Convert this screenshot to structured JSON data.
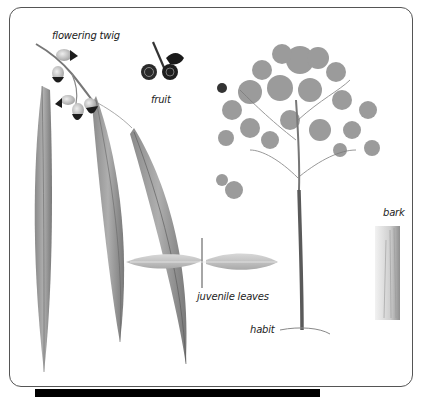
{
  "figure": {
    "labels": {
      "flowering_twig": "flowering twig",
      "fruit": "fruit",
      "juvenile_leaves": "juvenile leaves",
      "habit": "habit",
      "bark": "bark"
    }
  },
  "colors": {
    "frame_border": "#555555",
    "leaf": "#8c8c8c",
    "leaf_dark": "#5e5e5e",
    "juvenile_leaf": "#c9c9c9",
    "foliage": "#7a7a7a",
    "bud_cap": "#1c1c1c",
    "bottom_bar": "#000000"
  }
}
